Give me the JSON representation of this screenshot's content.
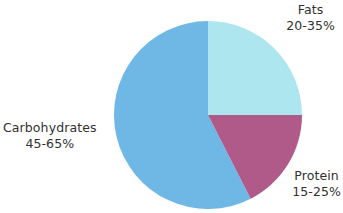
{
  "chart_data": {
    "type": "pie",
    "title": "",
    "subtitle": "",
    "xlabel": "",
    "ylabel": "",
    "legend_position": "none",
    "grid": false,
    "labels_outside": true,
    "categories": [
      "Fats",
      "Protein",
      "Carbohydrates"
    ],
    "values": [
      25,
      17.5,
      57.5
    ],
    "slices": [
      {
        "name": "Fats",
        "range_label": "20-35%",
        "range_min": 20,
        "range_max": 35,
        "value": 25,
        "color": "#aee6f0",
        "start_angle": 0,
        "end_angle": 90
      },
      {
        "name": "Protein",
        "range_label": "15-25%",
        "range_min": 15,
        "range_max": 25,
        "value": 17.5,
        "color": "#b05a8a",
        "start_angle": 90,
        "end_angle": 153
      },
      {
        "name": "Carbohydrates",
        "range_label": "45-65%",
        "range_min": 45,
        "range_max": 65,
        "value": 57.5,
        "color": "#6fb8e5",
        "start_angle": 153,
        "end_angle": 360
      }
    ],
    "annotations": []
  },
  "figure": {
    "background_color": "#ffffff",
    "text_color": "#333031",
    "center_x": 208,
    "center_y": 115,
    "radius": 94
  },
  "labels": {
    "fats": {
      "name": "Fats",
      "value": "20-35%"
    },
    "protein": {
      "name": "Protein",
      "value": "15-25%"
    },
    "carbohydrates": {
      "name": "Carbohydrates",
      "value": "45-65%"
    }
  }
}
